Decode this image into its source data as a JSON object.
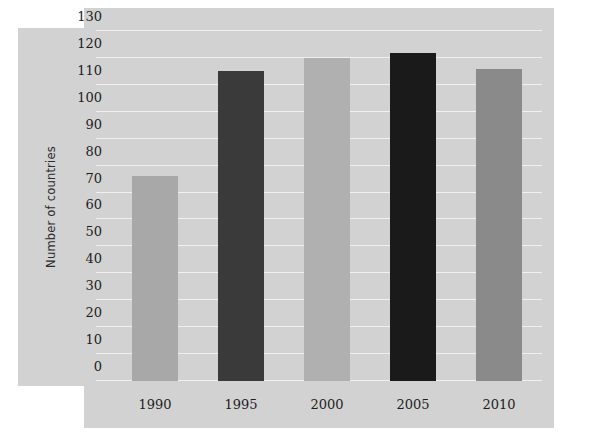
{
  "chart_data": {
    "type": "bar",
    "title": "",
    "xlabel": "",
    "ylabel": "Number of countries",
    "categories": [
      "1990",
      "1995",
      "2000",
      "2005",
      "2010"
    ],
    "values": [
      76,
      115,
      120,
      122,
      116
    ],
    "ylim": [
      0,
      130
    ],
    "yticks": [
      0,
      10,
      20,
      30,
      40,
      50,
      60,
      70,
      80,
      90,
      100,
      110,
      120,
      130
    ],
    "ytick_labels": [
      "0",
      "10",
      "20",
      "30",
      "40",
      "50",
      "60",
      "70",
      "80",
      "90",
      "100",
      "110",
      "120",
      "130"
    ],
    "grid": true,
    "gridline_color": "#f0f0f0",
    "legend": null,
    "legend_position": "none",
    "bar_colors": [
      "#a8a8a8",
      "#3a3a3a",
      "#b0b0b0",
      "#1a1a1a",
      "#8a8a8a"
    ],
    "panel_background": "#d2d2d2",
    "figure_background": "#ffffff",
    "text_color": "#1d1d1d"
  }
}
